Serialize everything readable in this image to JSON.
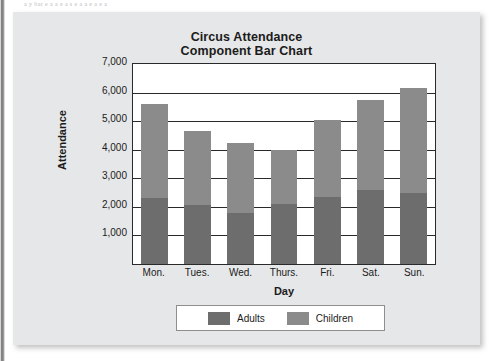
{
  "page": {
    "top_text_fragment": "a y bar e a a e  a  s e  a   a e a e  a"
  },
  "chart_data": {
    "type": "bar",
    "subtype": "stacked",
    "title": "Circus Attendance",
    "subtitle": "Component Bar Chart",
    "xlabel": "Day",
    "ylabel": "Attendance",
    "categories": [
      "Mon.",
      "Tues.",
      "Wed.",
      "Thurs.",
      "Fri.",
      "Sat.",
      "Sun."
    ],
    "series": [
      {
        "name": "Adults",
        "color": "#6d6d6d",
        "values": [
          2300,
          2050,
          1800,
          2100,
          2350,
          2600,
          2500
        ]
      },
      {
        "name": "Children",
        "color": "#8b8b8b",
        "values": [
          3300,
          2600,
          2450,
          1900,
          2700,
          3150,
          3650
        ]
      }
    ],
    "totals": [
      5600,
      4650,
      4250,
      4000,
      5050,
      5750,
      6150
    ],
    "ylim": [
      0,
      7000
    ],
    "ytick_values": [
      7000,
      6000,
      5000,
      4000,
      3000,
      2000,
      1000
    ],
    "ytick_labels": [
      "7,000",
      "6,000",
      "5,000",
      "4,000",
      "3,000",
      "2,000",
      "1,000"
    ],
    "grid": true,
    "legend_position": "bottom"
  }
}
